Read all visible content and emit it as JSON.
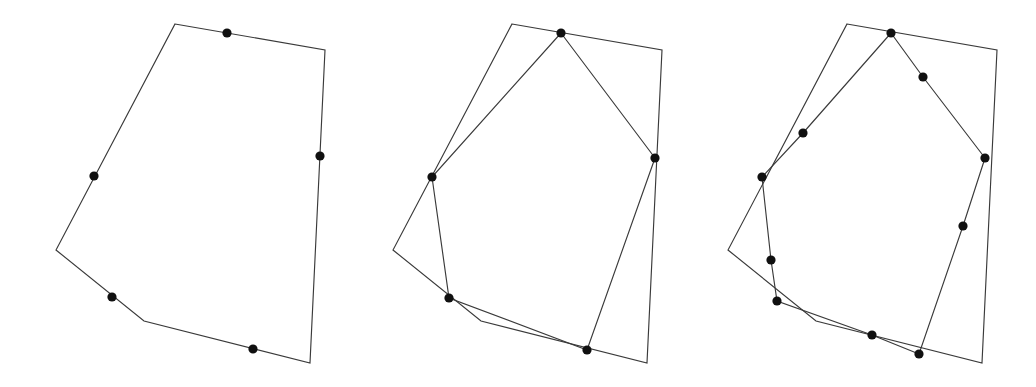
{
  "figure": {
    "background_color": "#ffffff",
    "stroke_color": "#3a3a3a",
    "dot_color": "#101010",
    "stroke_width": 1.15,
    "dot_radius": 4.6,
    "width": 1036,
    "height": 387,
    "panel_count": 3
  },
  "chart_data": {
    "type": "diagram",
    "subtype": "polygon-approximation",
    "xlabel": "",
    "ylabel": "",
    "xlim": [
      0,
      1036
    ],
    "ylim": [
      387,
      0
    ],
    "grid": false,
    "legend": false,
    "panels": [
      {
        "name": "panel-1",
        "index": 1,
        "vertex_count": 5,
        "outline": [
          [
            175,
            24
          ],
          [
            325,
            50
          ],
          [
            310,
            363
          ],
          [
            144,
            321
          ],
          [
            56,
            250
          ]
        ],
        "inner": [],
        "dots": [
          [
            227,
            33
          ],
          [
            320,
            156
          ],
          [
            253,
            349
          ],
          [
            112,
            297
          ],
          [
            94,
            176
          ]
        ]
      },
      {
        "name": "panel-2",
        "index": 2,
        "vertex_count": 5,
        "outline": [
          [
            512,
            24
          ],
          [
            662,
            50
          ],
          [
            647,
            363
          ],
          [
            481,
            321
          ],
          [
            393,
            250
          ]
        ],
        "inner": [
          [
            561,
            33
          ],
          [
            655,
            158
          ],
          [
            587,
            350
          ],
          [
            449,
            298
          ],
          [
            432,
            177
          ]
        ],
        "dots": [
          [
            561,
            33
          ],
          [
            655,
            158
          ],
          [
            587,
            350
          ],
          [
            449,
            298
          ],
          [
            432,
            177
          ]
        ]
      },
      {
        "name": "panel-3",
        "index": 3,
        "vertex_count": 10,
        "outline": [
          [
            847,
            24
          ],
          [
            997,
            50
          ],
          [
            982,
            363
          ],
          [
            816,
            321
          ],
          [
            728,
            250
          ]
        ],
        "inner": [
          [
            891,
            33
          ],
          [
            923,
            77
          ],
          [
            985,
            158
          ],
          [
            963,
            226
          ],
          [
            919,
            354
          ],
          [
            872,
            335
          ],
          [
            777,
            301
          ],
          [
            771,
            260
          ],
          [
            762,
            177
          ],
          [
            803,
            133
          ]
        ],
        "dots": [
          [
            891,
            33
          ],
          [
            923,
            77
          ],
          [
            985,
            158
          ],
          [
            963,
            226
          ],
          [
            919,
            354
          ],
          [
            872,
            335
          ],
          [
            777,
            301
          ],
          [
            771,
            260
          ],
          [
            762,
            177
          ],
          [
            803,
            133
          ]
        ]
      }
    ]
  }
}
